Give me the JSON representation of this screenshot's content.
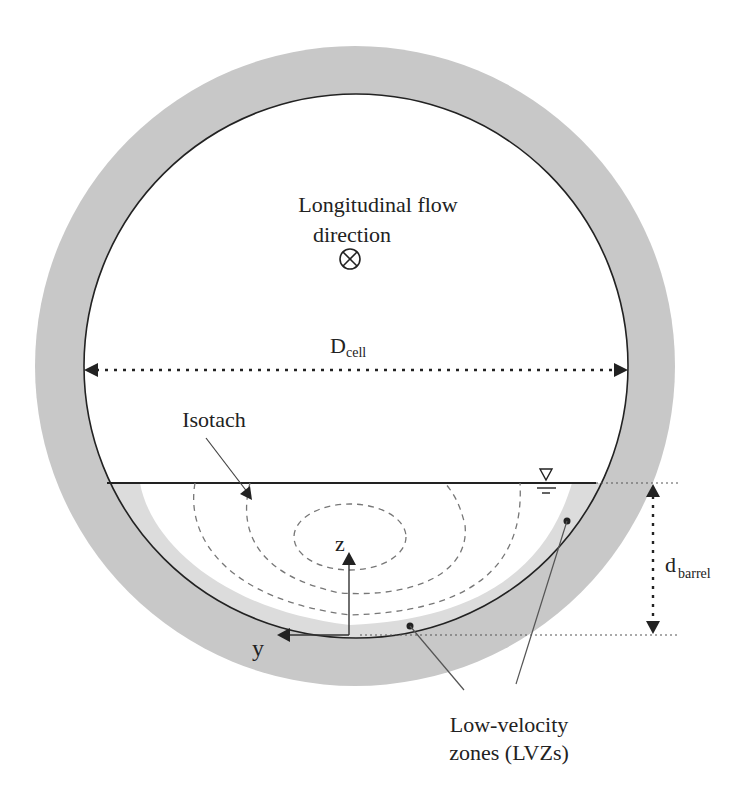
{
  "figure": {
    "type": "cross-section diagram"
  },
  "labels": {
    "flow_direction_line1": "Longitudinal flow",
    "flow_direction_line2": "direction",
    "flow_direction_symbol": "⊗",
    "diameter_main": "D",
    "diameter_sub": "cell",
    "isotach": "Isotach",
    "depth_main": "d",
    "depth_sub": "barrel",
    "axis_z": "z",
    "axis_y": "y",
    "lvz_line1": "Low-velocity",
    "lvz_line2": "zones (LVZs)",
    "water_surface_symbol": "▽"
  },
  "colors": {
    "pipe_wall": "#c8c8c8",
    "lvz_fill": "#dcdcdc",
    "interior": "#ffffff",
    "lines": "#222222",
    "isotach_dash": "#777777"
  }
}
